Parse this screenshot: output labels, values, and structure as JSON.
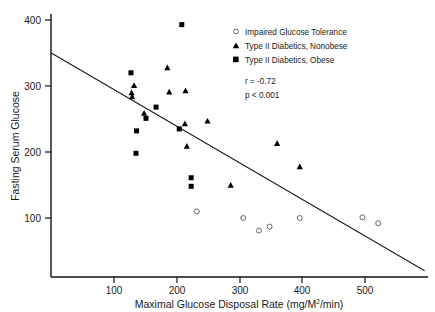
{
  "chart_data": {
    "type": "scatter",
    "title": "",
    "xlabel": "Maximal Glucose Disposal Rate (mg/M2/min)",
    "xlabel_main": "Maximal Glucose Disposal Rate (mg/M",
    "xlabel_sup": "2",
    "xlabel_tail": "/min)",
    "ylabel": "Fasting Serum Glucose",
    "xlim": [
      0,
      595
    ],
    "ylim": [
      0,
      420
    ],
    "xticks": [
      100,
      200,
      300,
      400,
      500
    ],
    "yticks": [
      100,
      200,
      300,
      400
    ],
    "grid": false,
    "legend_position": "top-right",
    "annotations": [
      {
        "name": "correlation",
        "text": "r = -0.72"
      },
      {
        "name": "pvalue",
        "text": "p < 0.001"
      }
    ],
    "fit_line": {
      "name": "regression-line",
      "x0": 0,
      "y0": 350,
      "x1": 595,
      "y1": 20
    },
    "series": [
      {
        "name": "Impaired Glucose Tolerance",
        "marker": "open-circle",
        "color": "#555555",
        "points": [
          [
            232,
            110
          ],
          [
            306,
            100
          ],
          [
            331,
            81
          ],
          [
            348,
            87
          ],
          [
            396,
            100
          ],
          [
            496,
            101
          ],
          [
            521,
            92
          ]
        ]
      },
      {
        "name": "Type II Diabetics, Nonobese",
        "marker": "filled-triangle",
        "color": "#000000",
        "points": [
          [
            128,
            290
          ],
          [
            129,
            284
          ],
          [
            132,
            301
          ],
          [
            148,
            259
          ],
          [
            185,
            328
          ],
          [
            188,
            291
          ],
          [
            214,
            293
          ],
          [
            213,
            243
          ],
          [
            216,
            209
          ],
          [
            249,
            247
          ],
          [
            286,
            150
          ],
          [
            360,
            213
          ],
          [
            396,
            178
          ]
        ]
      },
      {
        "name": "Type II Diabetics, Obese",
        "marker": "filled-square",
        "color": "#000000",
        "points": [
          [
            127,
            320
          ],
          [
            136,
            232
          ],
          [
            135,
            198
          ],
          [
            151,
            251
          ],
          [
            167,
            268
          ],
          [
            204,
            235
          ],
          [
            208,
            393
          ],
          [
            223,
            161
          ],
          [
            223,
            148
          ]
        ]
      }
    ]
  },
  "legend": {
    "items": [
      {
        "marker": "open-circle",
        "label": "Impaired Glucose Tolerance"
      },
      {
        "marker": "filled-triangle",
        "label": "Type II Diabetics, Nonobese"
      },
      {
        "marker": "filled-square",
        "label": "Type II Diabetics, Obese"
      }
    ]
  },
  "axis": {
    "x_tick_labels": [
      "100",
      "200",
      "300",
      "400",
      "500"
    ],
    "y_tick_labels": [
      "100",
      "200",
      "300",
      "400"
    ]
  }
}
